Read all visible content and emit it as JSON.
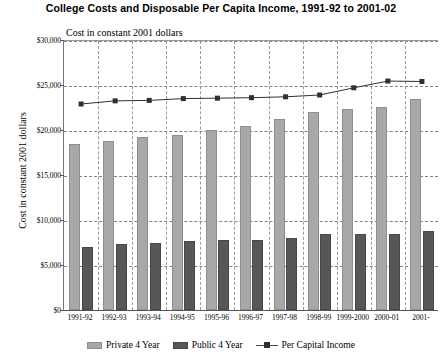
{
  "chart_data": {
    "type": "bar",
    "title": "College Costs and Disposable Per Capita Income, 1991-92 to 2001-02",
    "subtitle": "Cost in constant 2001 dollars",
    "xlabel": "",
    "ylabel": "Cost in constant 2001 dollars",
    "ylim": [
      0,
      30000
    ],
    "ytick_values": [
      0,
      5000,
      10000,
      15000,
      20000,
      25000,
      30000
    ],
    "ytick_labels": [
      "$0",
      "$5,000",
      "$10,000",
      "$15,000",
      "$20,000",
      "$25,000",
      "$30,000"
    ],
    "grid": true,
    "legend_position": "bottom",
    "categories": [
      "1991-92",
      "1992-93",
      "1993-94",
      "1994-95",
      "1995-96",
      "1996-97",
      "1997-98",
      "1998-99",
      "1999-2000",
      "2000-01",
      "2001-"
    ],
    "series": [
      {
        "name": "Private 4 Year",
        "kind": "bar",
        "color": "#a8a8a8",
        "values": [
          18400,
          18800,
          19250,
          19500,
          20000,
          20500,
          21200,
          22000,
          22300,
          22550,
          23500
        ]
      },
      {
        "name": "Public 4 Year",
        "kind": "bar",
        "color": "#575757",
        "values": [
          7000,
          7300,
          7500,
          7700,
          7750,
          7800,
          8000,
          8400,
          8450,
          8400,
          8750
        ]
      },
      {
        "name": "Per Capital Income",
        "kind": "line",
        "color": "#303030",
        "values": [
          23000,
          23350,
          23400,
          23600,
          23650,
          23700,
          23800,
          24000,
          24800,
          25550,
          25500
        ]
      }
    ]
  },
  "legend": {
    "items": [
      {
        "label": "Private 4 Year"
      },
      {
        "label": "Public 4 Year"
      },
      {
        "label": "Per Capital Income"
      }
    ]
  }
}
